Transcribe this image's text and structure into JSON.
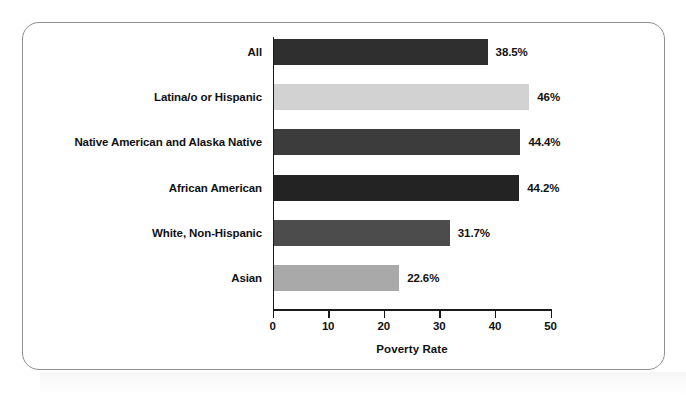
{
  "chart_data": {
    "type": "bar",
    "orientation": "horizontal",
    "title": "",
    "xlabel": "Poverty Rate",
    "ylabel": "",
    "xlim": [
      0,
      50
    ],
    "grid": false,
    "legend": "none",
    "xticks": [
      "0",
      "10",
      "20",
      "30",
      "40",
      "50"
    ],
    "xtick_values": [
      0,
      10,
      20,
      30,
      40,
      50
    ],
    "categories": [
      "All",
      "Latina/o or Hispanic",
      "Native American and Alaska Native",
      "African American",
      "White, Non-Hispanic",
      "Asian"
    ],
    "values": [
      38.5,
      46,
      44.4,
      44.2,
      31.7,
      22.6
    ],
    "value_labels": [
      "38.5%",
      "46%",
      "44.4%",
      "44.2%",
      "31.7%",
      "22.6%"
    ],
    "bar_colors": [
      "#2f2f2f",
      "#d2d2d2",
      "#3c3c3c",
      "#232323",
      "#4c4c4c",
      "#a9a9a9"
    ]
  },
  "frame": {
    "border_color": "#8e8e8e",
    "background": "#ffffff"
  }
}
